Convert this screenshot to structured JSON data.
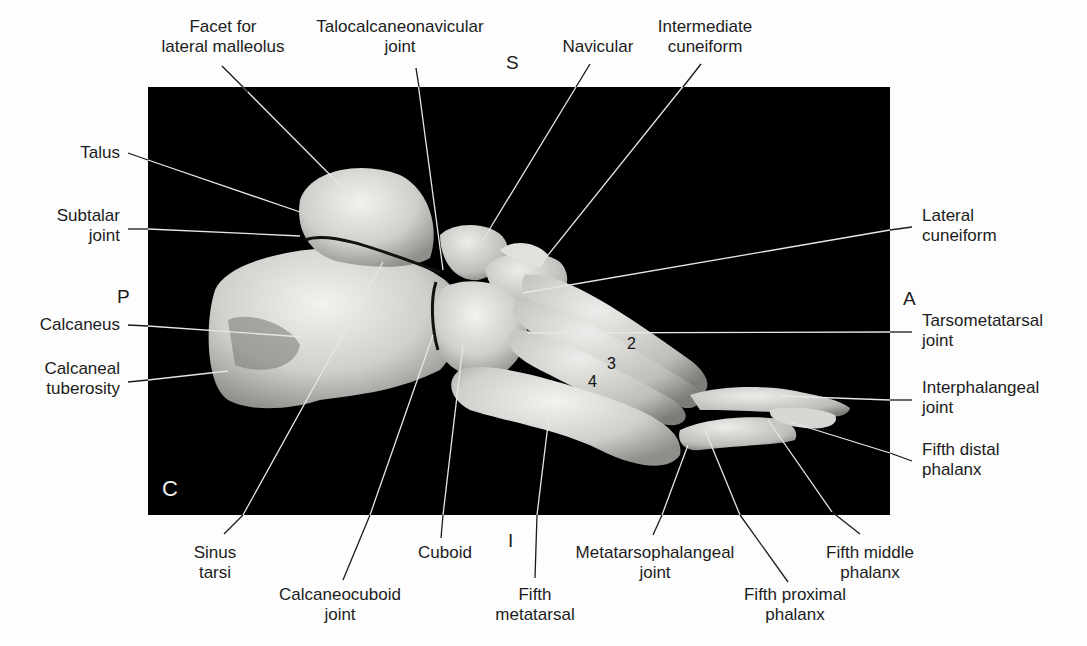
{
  "figure": {
    "view_marker": "C",
    "orientation": {
      "superior": "S",
      "inferior": "I",
      "posterior": "P",
      "anterior": "A"
    },
    "metatarsal_numbers": [
      "2",
      "3",
      "4"
    ],
    "colors": {
      "background": "#fdfdfd",
      "panel": "#000000",
      "bone": "#d9d9d6",
      "leader_on_panel": "#e8e8e8",
      "leader_off_panel": "#1a1a1a"
    }
  },
  "labels": {
    "facet_lateral_malleolus": "Facet for\nlateral malleolus",
    "talocalcaneonavicular_joint": "Talocalcaneonavicular\njoint",
    "navicular": "Navicular",
    "intermediate_cuneiform": "Intermediate\ncuneiform",
    "talus": "Talus",
    "subtalar_joint": "Subtalar\njoint",
    "calcaneus": "Calcaneus",
    "calcaneal_tuberosity": "Calcaneal\ntuberosity",
    "lateral_cuneiform": "Lateral\ncuneiform",
    "tarsometatarsal_joint": "Tarsometatarsal\njoint",
    "interphalangeal_joint": "Interphalangeal\njoint",
    "fifth_distal_phalanx": "Fifth distal\nphalanx",
    "sinus_tarsi": "Sinus\ntarsi",
    "calcaneocuboid_joint": "Calcaneocuboid\njoint",
    "cuboid": "Cuboid",
    "fifth_metatarsal": "Fifth\nmetatarsal",
    "metatarsophalangeal_joint": "Metatarsophalangeal\njoint",
    "fifth_proximal_phalanx": "Fifth proximal\nphalanx",
    "fifth_middle_phalanx": "Fifth middle\nphalanx"
  }
}
